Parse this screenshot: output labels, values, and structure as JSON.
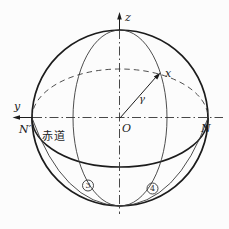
{
  "diagram": {
    "title_hint": "sphere with equator and reference directions",
    "axis_z_label": "z",
    "axis_y_label": "y",
    "origin_label": "O",
    "left_pole_label": "N′",
    "right_pole_label": "N",
    "vector_label": "x",
    "angle_label": "γ",
    "equator_label": "赤道",
    "region_3_digit": "3",
    "region_4_digit": "4",
    "colors": {
      "line_dark": "#1c1c1c",
      "line_light": "#3a3a3a",
      "background": "#fcfcfc"
    }
  }
}
